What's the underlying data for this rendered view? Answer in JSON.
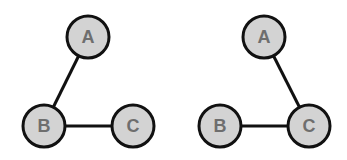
{
  "graphs": [
    {
      "name": "left-graph",
      "nodes": [
        {
          "id": "A",
          "label": "A",
          "cx": 88,
          "cy": 37
        },
        {
          "id": "B",
          "label": "B",
          "cx": 44,
          "cy": 126
        },
        {
          "id": "C",
          "label": "C",
          "cx": 133,
          "cy": 126
        }
      ],
      "edges": [
        [
          "A",
          "B"
        ],
        [
          "B",
          "C"
        ]
      ]
    },
    {
      "name": "right-graph",
      "nodes": [
        {
          "id": "A",
          "label": "A",
          "cx": 264,
          "cy": 37
        },
        {
          "id": "B",
          "label": "B",
          "cx": 220,
          "cy": 126
        },
        {
          "id": "C",
          "label": "C",
          "cx": 309,
          "cy": 126
        }
      ],
      "edges": [
        [
          "A",
          "C"
        ],
        [
          "B",
          "C"
        ]
      ]
    }
  ],
  "colors": {
    "node_fill": "#d3d3d3",
    "stroke": "#111111",
    "label": "#6e6e6e"
  }
}
